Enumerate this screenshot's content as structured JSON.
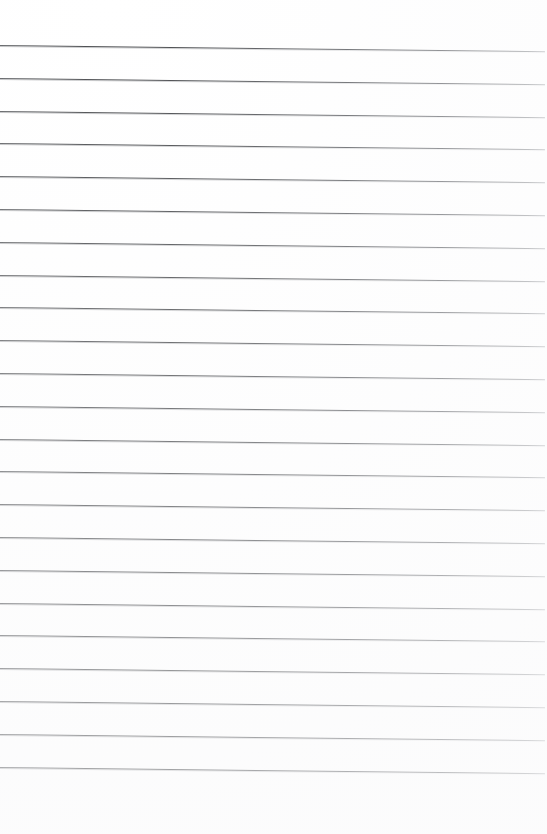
{
  "document": {
    "kind": "scanned-blank-lined-paper",
    "page_label": "",
    "has_text_content": false,
    "background_color": "#ffffff"
  },
  "canvas": {
    "width": 547,
    "height": 834
  },
  "ruling": {
    "name": "horizontal-ruled-lines",
    "line_count": 23,
    "line_color": "#4a4c4f",
    "line_color_faded": "#b9bbbe",
    "line_thickness_px": 1,
    "first_line_y": 45,
    "last_line_y": 768,
    "spacing_px": 32.8,
    "left_x": 0,
    "right_x": 545,
    "skew_degrees": 0.65,
    "top_margin_px": 45,
    "bottom_margin_px": 66
  },
  "lines": [
    {
      "index": 1,
      "y": 45,
      "label": ""
    },
    {
      "index": 2,
      "y": 77.8,
      "label": ""
    },
    {
      "index": 3,
      "y": 110.6,
      "label": ""
    },
    {
      "index": 4,
      "y": 143.4,
      "label": ""
    },
    {
      "index": 5,
      "y": 176.2,
      "label": ""
    },
    {
      "index": 6,
      "y": 209,
      "label": ""
    },
    {
      "index": 7,
      "y": 241.8,
      "label": ""
    },
    {
      "index": 8,
      "y": 274.6,
      "label": ""
    },
    {
      "index": 9,
      "y": 307.4,
      "label": ""
    },
    {
      "index": 10,
      "y": 340.2,
      "label": ""
    },
    {
      "index": 11,
      "y": 373,
      "label": ""
    },
    {
      "index": 12,
      "y": 405.8,
      "label": ""
    },
    {
      "index": 13,
      "y": 438.6,
      "label": ""
    },
    {
      "index": 14,
      "y": 471.4,
      "label": ""
    },
    {
      "index": 15,
      "y": 504.2,
      "label": ""
    },
    {
      "index": 16,
      "y": 537,
      "label": ""
    },
    {
      "index": 17,
      "y": 569.8,
      "label": ""
    },
    {
      "index": 18,
      "y": 602.6,
      "label": ""
    },
    {
      "index": 19,
      "y": 635.4,
      "label": ""
    },
    {
      "index": 20,
      "y": 668.2,
      "label": ""
    },
    {
      "index": 21,
      "y": 701,
      "label": ""
    },
    {
      "index": 22,
      "y": 733.8,
      "label": ""
    },
    {
      "index": 23,
      "y": 766.6,
      "label": ""
    }
  ]
}
